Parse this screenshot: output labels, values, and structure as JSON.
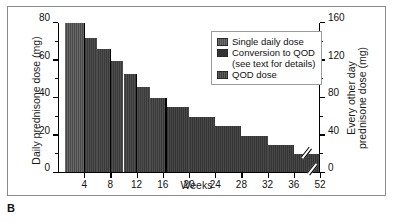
{
  "panel": {
    "letter": "B"
  },
  "chart_data": {
    "type": "bar",
    "title": "",
    "xlabel": "Weeks",
    "ylabel": "Daily prednisone dose (mg)",
    "y2label_line1": "Every other day",
    "y2label_line2": "prednisone dose (mg)",
    "xlim": [
      0,
      40
    ],
    "ylim": [
      0,
      80
    ],
    "y2lim": [
      0,
      160
    ],
    "grid": false,
    "legend_position": "upper-right",
    "x_tick_labels": [
      "4",
      "8",
      "12",
      "16",
      "20",
      "24",
      "28",
      "32",
      "36",
      "52"
    ],
    "x_tick_values": [
      4,
      8,
      12,
      16,
      20,
      24,
      28,
      32,
      36,
      40
    ],
    "y_tick_labels": [
      "0",
      "20",
      "40",
      "60",
      "80"
    ],
    "y_tick_values": [
      0,
      20,
      40,
      60,
      80
    ],
    "y_minor_ticks": [
      10,
      30,
      50,
      70
    ],
    "y2_tick_labels": [
      "0",
      "40",
      "80",
      "120",
      "160"
    ],
    "y2_tick_values": [
      0,
      40,
      80,
      120,
      160
    ],
    "y2_minor_ticks": [
      20,
      60,
      100,
      140
    ],
    "axis_break": {
      "present": true,
      "between_labels": [
        "36",
        "52"
      ],
      "at_value": 38.2
    },
    "bars": [
      {
        "x_start": 1.0,
        "x_end": 4.0,
        "value": 80,
        "segment": "single-daily-dose"
      },
      {
        "x_start": 4.0,
        "x_end": 6.0,
        "value": 72,
        "segment": "conversion-to-qod"
      },
      {
        "x_start": 6.0,
        "x_end": 8.0,
        "value": 66,
        "segment": "conversion-to-qod"
      },
      {
        "x_start": 8.0,
        "x_end": 10.0,
        "value": 60,
        "segment": "conversion-to-qod"
      },
      {
        "x_start": 10.0,
        "x_end": 12.0,
        "value": 53,
        "segment": "conversion-to-qod"
      },
      {
        "x_start": 12.0,
        "x_end": 14.0,
        "value": 46,
        "segment": "conversion-to-qod"
      },
      {
        "x_start": 14.0,
        "x_end": 16.5,
        "value": 40,
        "segment": "conversion-to-qod"
      },
      {
        "x_start": 16.5,
        "x_end": 20.0,
        "value": 35,
        "segment": "qod-dose"
      },
      {
        "x_start": 20.0,
        "x_end": 24.0,
        "value": 30,
        "segment": "qod-dose"
      },
      {
        "x_start": 24.0,
        "x_end": 28.0,
        "value": 25,
        "segment": "qod-dose"
      },
      {
        "x_start": 28.0,
        "x_end": 32.0,
        "value": 20,
        "segment": "qod-dose"
      },
      {
        "x_start": 32.0,
        "x_end": 36.0,
        "value": 15,
        "segment": "qod-dose"
      },
      {
        "x_start": 36.0,
        "x_end": 40.0,
        "value": 10,
        "segment": "qod-dose"
      }
    ],
    "phase_dividers": [
      4.0,
      8.0,
      12.0,
      16.5
    ],
    "legend": [
      {
        "label": "Single daily dose",
        "swatch": "s-single"
      },
      {
        "label": "Conversion to QOD",
        "swatch": "s-conv"
      },
      {
        "label": "(see text for details)",
        "swatch": null
      },
      {
        "label": "QOD dose",
        "swatch": "s-qod"
      }
    ]
  }
}
